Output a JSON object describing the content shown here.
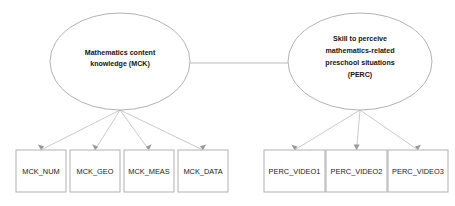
{
  "diagram": {
    "type": "structural-equation-model-path-diagram",
    "background_color": "#ffffff",
    "shape_stroke_color": "#a9a9a9",
    "path_stroke_color": "#b3b3b3",
    "text_color": "#141414",
    "latent_variables": [
      {
        "id": "MCK",
        "name": "Mathematics content knowledge (MCK)",
        "lines": [
          "Mathematics content",
          "knowledge (MCK)"
        ],
        "shape": "ellipse",
        "cx": 120,
        "cy": 61.5,
        "rx": 70,
        "ry": 48.5
      },
      {
        "id": "PERC",
        "name": "Skill to perceive mathematics-related preschool situations (PERC)",
        "lines": [
          "Skill to perceive",
          "mathematics-related",
          "preschool situations",
          "(PERC)"
        ],
        "shape": "ellipse",
        "cx": 360,
        "cy": 61.5,
        "rx": 72,
        "ry": 48.5
      }
    ],
    "indicators": [
      {
        "id": "MCK_NUM",
        "label": "MCK_NUM",
        "parent": "MCK",
        "x": 16,
        "y": 150,
        "width": 50,
        "height": 42
      },
      {
        "id": "MCK_GEO",
        "label": "MCK_GEO",
        "parent": "MCK",
        "x": 70,
        "y": 150,
        "width": 50,
        "height": 42
      },
      {
        "id": "MCK_MEAS",
        "label": "MCK_MEAS",
        "parent": "MCK",
        "x": 124,
        "y": 150,
        "width": 50,
        "height": 42
      },
      {
        "id": "MCK_DATA",
        "label": "MCK_DATA",
        "parent": "MCK",
        "x": 178,
        "y": 150,
        "width": 50,
        "height": 42
      },
      {
        "id": "PERC_VIDEO1",
        "label": "PERC_VIDEO1",
        "parent": "PERC",
        "x": 264,
        "y": 150,
        "width": 61,
        "height": 42
      },
      {
        "id": "PERC_VIDEO2",
        "label": "PERC_VIDEO2",
        "parent": "PERC",
        "x": 326,
        "y": 150,
        "width": 61,
        "height": 42
      },
      {
        "id": "PERC_VIDEO3",
        "label": "PERC_VIDEO3",
        "parent": "PERC",
        "x": 388,
        "y": 150,
        "width": 60,
        "height": 42
      }
    ],
    "covariance_path": {
      "from": "MCK",
      "to": "PERC",
      "label": "",
      "x1": 190,
      "x2": 288,
      "y": 63
    }
  }
}
